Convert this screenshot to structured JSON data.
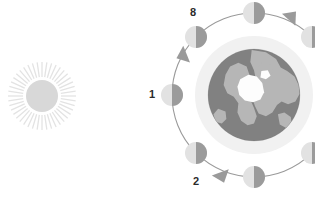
{
  "diagram": {
    "canvas": {
      "width": 315,
      "height": 200,
      "background": "#ffffff"
    }
  },
  "colors": {
    "sun_disc": "#d8d8d8",
    "sun_rays": "#e3e3e3",
    "earth_ocean": "#818181",
    "earth_land": "#b6b6b6",
    "earth_ice": "#fdfdfd",
    "earth_halo": "#f1f1f1",
    "orbit_line": "#9a9a9a",
    "moon_light": "#e2e2e2",
    "moon_dark": "#9b9b9b",
    "arrow": "#9a9a9a",
    "label_text": "#2b2b2b"
  },
  "sun": {
    "name": "Sun",
    "cx": 42,
    "cy": 96,
    "r": 16,
    "ray_count": 44,
    "ray_inner": 19,
    "ray_outer": 34
  },
  "earth": {
    "name": "Earth",
    "cx": 254,
    "cy": 95,
    "r": 46,
    "halo_r": 59
  },
  "orbit": {
    "cx": 254,
    "cy": 95,
    "r": 82,
    "direction": "counterclockwise"
  },
  "moons": [
    {
      "id": "moon-1",
      "label": "1",
      "angle_deg": 180,
      "cx": 172,
      "cy": 95,
      "r": 11,
      "label_x": 152,
      "label_y": 95,
      "show_label": true
    },
    {
      "id": "moon-2",
      "label": "2",
      "angle_deg": 225,
      "cx": 196,
      "cy": 153,
      "r": 11,
      "label_x": 196,
      "label_y": 182,
      "show_label": true
    },
    {
      "id": "moon-3",
      "label": "3",
      "angle_deg": 270,
      "cx": 254,
      "cy": 177,
      "r": 11,
      "label_x": 254,
      "label_y": 197,
      "show_label": false
    },
    {
      "id": "moon-4",
      "label": "4",
      "angle_deg": 315,
      "cx": 312,
      "cy": 153,
      "r": 11,
      "label_x": 312,
      "label_y": 182,
      "show_label": false
    },
    {
      "id": "moon-7",
      "label": "7",
      "angle_deg": 45,
      "cx": 312,
      "cy": 37,
      "r": 11,
      "label_x": 312,
      "label_y": 16,
      "show_label": false
    },
    {
      "id": "moon-8-top",
      "label": "",
      "angle_deg": 90,
      "cx": 254,
      "cy": 13,
      "r": 11,
      "label_x": 254,
      "label_y": -6,
      "show_label": false
    },
    {
      "id": "moon-8",
      "label": "8",
      "angle_deg": 135,
      "cx": 196,
      "cy": 37,
      "r": 11,
      "label_x": 193,
      "label_y": 13,
      "show_label": true
    }
  ],
  "arrows": [
    {
      "id": "arrow-upper-left",
      "x": 182,
      "y": 56,
      "rotation_deg": 248
    },
    {
      "id": "arrow-lower-left",
      "x": 222,
      "y": 177,
      "rotation_deg": 160
    },
    {
      "id": "arrow-upper-right",
      "x": 292,
      "y": 16,
      "rotation_deg": 42
    }
  ],
  "labels": {
    "one": "1",
    "two": "2",
    "eight": "8"
  }
}
